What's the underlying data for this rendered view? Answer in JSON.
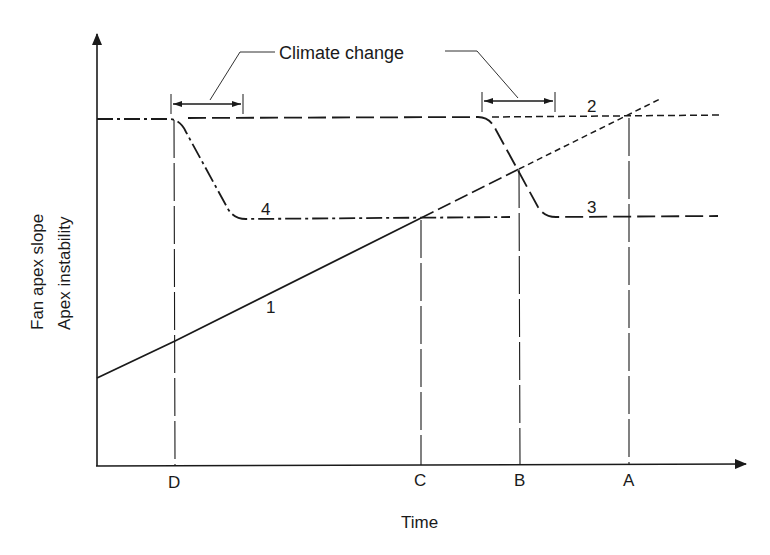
{
  "figure": {
    "type": "conceptual diagram",
    "y_axis_label_line1": "Fan apex slope",
    "y_axis_label_line2": "Apex instability",
    "x_axis_label": "Time",
    "annotation": "Climate change",
    "time_markers": [
      {
        "label": "D",
        "x": 175
      },
      {
        "label": "C",
        "x": 421
      },
      {
        "label": "B",
        "x": 520
      },
      {
        "label": "A",
        "x": 629
      }
    ],
    "curve_labels": [
      {
        "label": "1",
        "description": "Fan apex slope (rising, solid then short-dashed)"
      },
      {
        "label": "2",
        "description": "Apex instability threshold, no climate change (short-dashed)"
      },
      {
        "label": "3",
        "description": "Threshold after later climate change (long-dashed)"
      },
      {
        "label": "4",
        "description": "Threshold after earlier climate change (dash-dot)"
      }
    ],
    "colors": {
      "ink": "#1a1a1a",
      "background": "#ffffff"
    }
  }
}
